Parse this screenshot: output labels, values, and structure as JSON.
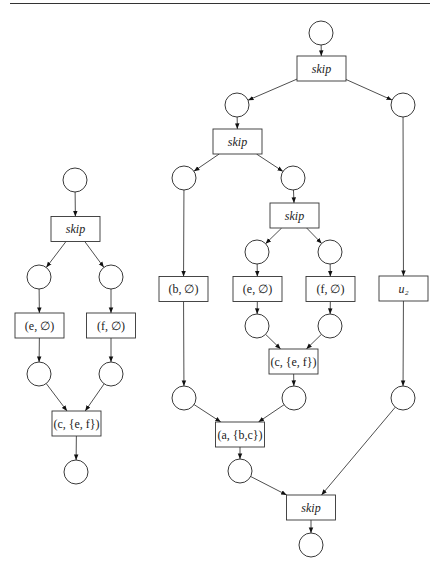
{
  "diagram": {
    "type": "petri-net",
    "nets": [
      {
        "name": "left-net",
        "places": [
          "p1",
          "p2",
          "p3",
          "p4",
          "p5",
          "p6"
        ],
        "transitions": [
          {
            "id": "t1",
            "label": "skip",
            "italic": true
          },
          {
            "id": "t2",
            "label": "(e, ∅)",
            "italic": false
          },
          {
            "id": "t3",
            "label": "(f, ∅)",
            "italic": false
          },
          {
            "id": "t4",
            "label": "(c, {e, f})",
            "italic": false
          }
        ],
        "arcs": [
          [
            "p1",
            "t1"
          ],
          [
            "t1",
            "p2"
          ],
          [
            "t1",
            "p3"
          ],
          [
            "p2",
            "t2"
          ],
          [
            "p3",
            "t3"
          ],
          [
            "t2",
            "p4"
          ],
          [
            "t3",
            "p5"
          ],
          [
            "p4",
            "t4"
          ],
          [
            "p5",
            "t4"
          ],
          [
            "t4",
            "p6"
          ]
        ]
      },
      {
        "name": "right-net",
        "places": [
          "q1",
          "q2",
          "q3",
          "q4",
          "q5",
          "q6",
          "q7",
          "q8",
          "q9",
          "q10",
          "q11",
          "q12",
          "q13"
        ],
        "transitions": [
          {
            "id": "s1",
            "label": "skip",
            "italic": true
          },
          {
            "id": "s2",
            "label": "skip",
            "italic": true
          },
          {
            "id": "s3",
            "label": "skip",
            "italic": true
          },
          {
            "id": "s4",
            "label": "(b, ∅)",
            "italic": false
          },
          {
            "id": "s5",
            "label": "(e, ∅)",
            "italic": false
          },
          {
            "id": "s6",
            "label": "(f, ∅)",
            "italic": false
          },
          {
            "id": "s7",
            "label": "u₂",
            "italic": true
          },
          {
            "id": "s8",
            "label": "(c, {e, f})",
            "italic": false
          },
          {
            "id": "s9",
            "label": "(a, {b,c})",
            "italic": false
          },
          {
            "id": "s10",
            "label": "skip",
            "italic": true
          }
        ],
        "arcs": [
          [
            "q1",
            "s1"
          ],
          [
            "s1",
            "q2"
          ],
          [
            "s1",
            "q3"
          ],
          [
            "q2",
            "s2"
          ],
          [
            "s2",
            "q4"
          ],
          [
            "s2",
            "q5"
          ],
          [
            "q5",
            "s3"
          ],
          [
            "s3",
            "q6"
          ],
          [
            "s3",
            "q7"
          ],
          [
            "q4",
            "s4"
          ],
          [
            "q6",
            "s5"
          ],
          [
            "q7",
            "s6"
          ],
          [
            "q3",
            "s7"
          ],
          [
            "s5",
            "q8"
          ],
          [
            "s6",
            "q9"
          ],
          [
            "q8",
            "s8"
          ],
          [
            "q9",
            "s8"
          ],
          [
            "s4",
            "q10"
          ],
          [
            "s8",
            "q11"
          ],
          [
            "s7",
            "q12"
          ],
          [
            "q10",
            "s9"
          ],
          [
            "q11",
            "s9"
          ],
          [
            "s9",
            "q13"
          ],
          [
            "q13",
            "s10"
          ],
          [
            "q12",
            "s10"
          ],
          [
            "s10",
            "q14"
          ]
        ]
      }
    ]
  }
}
